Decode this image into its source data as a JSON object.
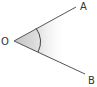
{
  "diagram": {
    "type": "angle",
    "labels": {
      "vertex": "O",
      "point_a": "A",
      "point_b": "B"
    },
    "colors": {
      "line": "#555555",
      "arc": "#444444",
      "shade": "#c8c8c8",
      "label": "#333333"
    }
  }
}
